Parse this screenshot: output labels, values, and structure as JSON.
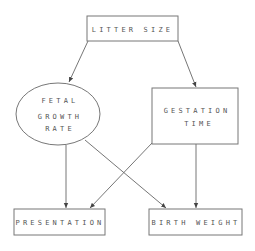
{
  "diagram": {
    "type": "causal-path-diagram",
    "nodes": {
      "litter_size": {
        "label": "LITTER SIZE",
        "shape": "rectangle"
      },
      "fetal_growth_rate": {
        "label_lines": [
          "FETAL",
          "GROWTH",
          "RATE"
        ],
        "shape": "ellipse"
      },
      "gestation_time": {
        "label_lines": [
          "GESTATION",
          "TIME"
        ],
        "shape": "rectangle"
      },
      "presentation": {
        "label": "PRESENTATION",
        "shape": "rectangle"
      },
      "birth_weight": {
        "label": "BIRTH WEIGHT",
        "shape": "rectangle"
      }
    },
    "edges": [
      {
        "from": "LITTER SIZE",
        "to": "FETAL GROWTH RATE"
      },
      {
        "from": "LITTER SIZE",
        "to": "GESTATION TIME"
      },
      {
        "from": "FETAL GROWTH RATE",
        "to": "PRESENTATION"
      },
      {
        "from": "FETAL GROWTH RATE",
        "to": "BIRTH WEIGHT"
      },
      {
        "from": "GESTATION TIME",
        "to": "PRESENTATION"
      },
      {
        "from": "GESTATION TIME",
        "to": "BIRTH WEIGHT"
      }
    ],
    "colors": {
      "stroke": "#777777",
      "text": "#555555",
      "background": "#ffffff"
    }
  }
}
